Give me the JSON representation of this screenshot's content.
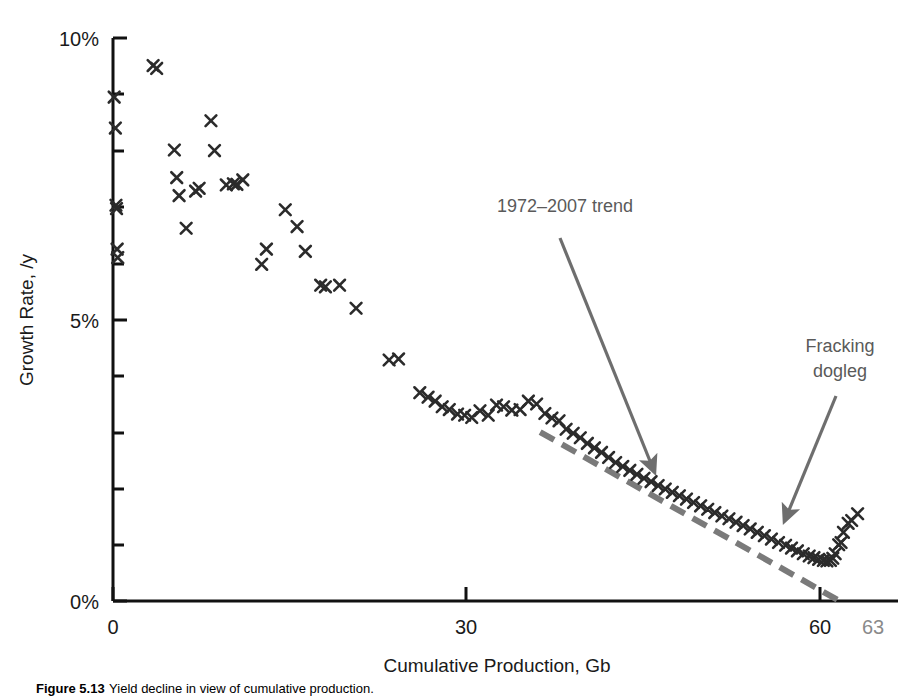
{
  "chart_data": {
    "type": "scatter",
    "title": "",
    "xlabel": "Cumulative Production, Gb",
    "ylabel": "Growth Rate, /y",
    "xlim": [
      0,
      65
    ],
    "ylim": [
      0,
      0.1
    ],
    "grid": false,
    "legend_position": "none",
    "x_ticks": [
      {
        "value": 0,
        "label": "0",
        "color": "#1a1a1a"
      },
      {
        "value": 30,
        "label": "30",
        "color": "#1a1a1a"
      },
      {
        "value": 60,
        "label": "60",
        "color": "#1a1a1a"
      },
      {
        "value": 63,
        "label": "63",
        "color": "#8a8a8a"
      }
    ],
    "x_minor_ticks": [
      0,
      30,
      60
    ],
    "y_ticks": [
      {
        "value": 0.0,
        "label": "0%"
      },
      {
        "value": 0.05,
        "label": "5%"
      },
      {
        "value": 0.1,
        "label": "10%"
      }
    ],
    "y_minor_ticks": [
      0.01,
      0.02,
      0.03,
      0.04,
      0.06,
      0.07,
      0.08,
      0.09
    ],
    "y_tick_format": "percent",
    "marker": "x",
    "marker_color": "#2b2b2b",
    "series": [
      {
        "name": "Texas oil growth rate vs cumulative production",
        "points": [
          [
            0.1,
            0.0895
          ],
          [
            0.2,
            0.084
          ],
          [
            0.25,
            0.0703
          ],
          [
            0.3,
            0.0697
          ],
          [
            0.35,
            0.0625
          ],
          [
            0.4,
            0.061
          ],
          [
            3.4,
            0.0951
          ],
          [
            3.7,
            0.0946
          ],
          [
            5.2,
            0.0801
          ],
          [
            5.4,
            0.0752
          ],
          [
            5.6,
            0.072
          ],
          [
            7.0,
            0.0728
          ],
          [
            7.3,
            0.0733
          ],
          [
            8.3,
            0.0853
          ],
          [
            8.6,
            0.08
          ],
          [
            6.2,
            0.0662
          ],
          [
            9.6,
            0.0739
          ],
          [
            10.2,
            0.0741
          ],
          [
            10.5,
            0.074
          ],
          [
            11.0,
            0.0748
          ],
          [
            12.6,
            0.0598
          ],
          [
            13.0,
            0.0625
          ],
          [
            14.6,
            0.0695
          ],
          [
            15.6,
            0.0665
          ],
          [
            16.3,
            0.0621
          ],
          [
            17.6,
            0.0561
          ],
          [
            18.0,
            0.0558
          ],
          [
            19.2,
            0.0561
          ],
          [
            20.6,
            0.052
          ],
          [
            23.4,
            0.0428
          ],
          [
            24.2,
            0.043
          ],
          [
            26.0,
            0.037
          ],
          [
            26.7,
            0.0362
          ],
          [
            27.3,
            0.0355
          ],
          [
            27.9,
            0.0345
          ],
          [
            28.5,
            0.034
          ],
          [
            29.2,
            0.0332
          ],
          [
            29.8,
            0.033
          ],
          [
            30.4,
            0.0326
          ],
          [
            31.1,
            0.0338
          ],
          [
            31.8,
            0.033
          ],
          [
            32.5,
            0.0348
          ],
          [
            33.1,
            0.0345
          ],
          [
            33.8,
            0.0339
          ],
          [
            34.5,
            0.034
          ],
          [
            35.2,
            0.0355
          ],
          [
            35.9,
            0.035
          ],
          [
            36.6,
            0.0333
          ],
          [
            37.2,
            0.0325
          ],
          [
            37.8,
            0.032
          ],
          [
            38.4,
            0.0305
          ],
          [
            39.0,
            0.0298
          ],
          [
            39.6,
            0.029
          ],
          [
            40.2,
            0.028
          ],
          [
            40.8,
            0.0272
          ],
          [
            41.4,
            0.0264
          ],
          [
            42.0,
            0.0255
          ],
          [
            42.6,
            0.0246
          ],
          [
            43.2,
            0.0239
          ],
          [
            43.8,
            0.0232
          ],
          [
            44.4,
            0.0225
          ],
          [
            45.0,
            0.0218
          ],
          [
            45.6,
            0.0212
          ],
          [
            46.2,
            0.0205
          ],
          [
            46.8,
            0.0199
          ],
          [
            47.4,
            0.0193
          ],
          [
            48.0,
            0.0187
          ],
          [
            48.6,
            0.0181
          ],
          [
            49.2,
            0.0175
          ],
          [
            49.8,
            0.0169
          ],
          [
            50.4,
            0.0163
          ],
          [
            51.0,
            0.0157
          ],
          [
            51.6,
            0.0151
          ],
          [
            52.2,
            0.0146
          ],
          [
            52.8,
            0.014
          ],
          [
            53.4,
            0.0134
          ],
          [
            54.0,
            0.0128
          ],
          [
            54.6,
            0.0122
          ],
          [
            55.2,
            0.0116
          ],
          [
            55.8,
            0.011
          ],
          [
            56.4,
            0.0104
          ],
          [
            57.0,
            0.0099
          ],
          [
            57.5,
            0.0094
          ],
          [
            58.0,
            0.0089
          ],
          [
            58.5,
            0.0084
          ],
          [
            59.0,
            0.008
          ],
          [
            59.4,
            0.0077
          ],
          [
            59.8,
            0.0074
          ],
          [
            60.2,
            0.0072
          ],
          [
            60.5,
            0.0071
          ],
          [
            60.8,
            0.0072
          ],
          [
            61.0,
            0.0076
          ],
          [
            61.2,
            0.0084
          ],
          [
            61.5,
            0.01
          ],
          [
            61.7,
            0.0104
          ],
          [
            61.9,
            0.0122
          ],
          [
            62.3,
            0.0138
          ],
          [
            62.6,
            0.0143
          ],
          [
            63.1,
            0.0155
          ]
        ]
      }
    ],
    "trend_line": {
      "name": "1972-2007 trend",
      "style": "dashed",
      "color": "#7a7a7a",
      "from": [
        36.2,
        0.03
      ],
      "to": [
        62.0,
        -0.0005
      ]
    },
    "annotations": [
      {
        "id": "trend-annotation",
        "text": "1972–2007 trend",
        "text_x": 497,
        "text_y": 212,
        "arrow_from_x": 560,
        "arrow_from_y": 238,
        "arrow_to_x": 655,
        "arrow_to_y": 470,
        "color": "#5a5a5a"
      },
      {
        "id": "dogleg-annotation",
        "text_lines": [
          "Fracking",
          "dogleg"
        ],
        "text_x": 840,
        "text_y": 352,
        "arrow_from_x": 835,
        "arrow_from_y": 398,
        "arrow_to_x": 783,
        "arrow_to_y": 520,
        "color": "#5a5a5a"
      }
    ]
  },
  "figure": {
    "caption_number": "Figure 5.13",
    "caption_text": "Yield decline in view of cumulative production."
  }
}
